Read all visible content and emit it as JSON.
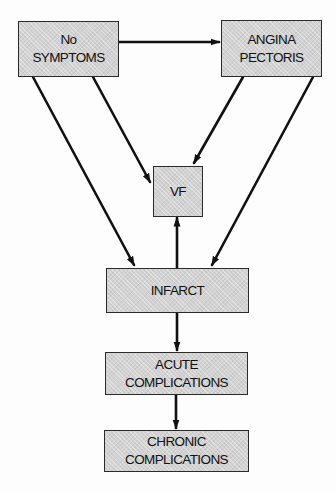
{
  "diagram": {
    "type": "flowchart",
    "nodes": [
      {
        "id": "no_symptoms",
        "label": "No\nSYMPTOMS"
      },
      {
        "id": "angina",
        "label": "ANGINA\nPECTORIS"
      },
      {
        "id": "vf",
        "label": "VF"
      },
      {
        "id": "infarct",
        "label": "INFARCT"
      },
      {
        "id": "acute",
        "label": "ACUTE\nCOMPLICATIONS"
      },
      {
        "id": "chronic",
        "label": "CHRONIC\nCOMPLICATIONS"
      }
    ],
    "edges": [
      {
        "from": "no_symptoms",
        "to": "angina"
      },
      {
        "from": "no_symptoms",
        "to": "vf"
      },
      {
        "from": "no_symptoms",
        "to": "infarct"
      },
      {
        "from": "angina",
        "to": "vf"
      },
      {
        "from": "angina",
        "to": "infarct"
      },
      {
        "from": "infarct",
        "to": "vf"
      },
      {
        "from": "infarct",
        "to": "acute"
      },
      {
        "from": "acute",
        "to": "chronic"
      }
    ],
    "colors": {
      "box_fill": "#d2d2d2",
      "box_border": "#2a2a2a",
      "arrow": "#111111"
    }
  }
}
